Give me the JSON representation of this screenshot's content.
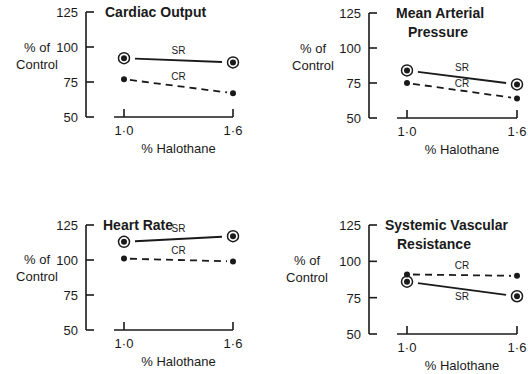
{
  "chart_data": [
    {
      "type": "line",
      "title": "Cardiac Output",
      "title_lines": [
        "Cardiac Output"
      ],
      "xlabel": "% Halothane",
      "ylabel": "% of Control",
      "x": [
        1.0,
        1.6
      ],
      "x_tick_labels": [
        "1·0",
        "1·6"
      ],
      "y_ticks": [
        125,
        100,
        75,
        50
      ],
      "ylim": [
        50,
        125
      ],
      "grid": false,
      "series": [
        {
          "name": "SR",
          "style": "solid",
          "marker": "ringed-dot",
          "values": [
            92,
            89
          ]
        },
        {
          "name": "CR",
          "style": "dashed",
          "marker": "dot",
          "values": [
            77,
            67
          ]
        }
      ]
    },
    {
      "type": "line",
      "title": "Mean Arterial Pressure",
      "title_lines": [
        "Mean Arterial",
        "Pressure"
      ],
      "xlabel": "% Halothane",
      "ylabel": "% of Control",
      "x": [
        1.0,
        1.6
      ],
      "x_tick_labels": [
        "1·0",
        "1·6"
      ],
      "y_ticks": [
        125,
        100,
        75,
        50
      ],
      "ylim": [
        50,
        125
      ],
      "grid": false,
      "series": [
        {
          "name": "SR",
          "style": "solid",
          "marker": "ringed-dot",
          "values": [
            84,
            74
          ]
        },
        {
          "name": "CR",
          "style": "dashed",
          "marker": "dot",
          "values": [
            75,
            64
          ]
        }
      ]
    },
    {
      "type": "line",
      "title": "Heart Rate",
      "title_lines": [
        "Heart Rate"
      ],
      "xlabel": "% Halothane",
      "ylabel": "% of Control",
      "x": [
        1.0,
        1.6
      ],
      "x_tick_labels": [
        "1·0",
        "1·6"
      ],
      "y_ticks": [
        125,
        100,
        75,
        50
      ],
      "ylim": [
        50,
        125
      ],
      "grid": false,
      "series": [
        {
          "name": "SR",
          "style": "solid",
          "marker": "ringed-dot",
          "values": [
            113,
            117
          ]
        },
        {
          "name": "CR",
          "style": "dashed",
          "marker": "dot",
          "values": [
            101,
            99
          ]
        }
      ]
    },
    {
      "type": "line",
      "title": "Systemic Vascular Resistance",
      "title_lines": [
        "Systemic Vascular",
        "Resistance"
      ],
      "xlabel": "% Halothane",
      "ylabel": "% of Control",
      "x": [
        1.0,
        1.6
      ],
      "x_tick_labels": [
        "1·0",
        "1·6"
      ],
      "y_ticks": [
        125,
        100,
        75,
        50
      ],
      "ylim": [
        50,
        125
      ],
      "grid": false,
      "series": [
        {
          "name": "SR",
          "style": "solid",
          "marker": "ringed-dot",
          "values": [
            86,
            76
          ]
        },
        {
          "name": "CR",
          "style": "dashed",
          "marker": "dot",
          "values": [
            91,
            90
          ]
        }
      ]
    }
  ],
  "layout": {
    "panels": [
      {
        "axis_x": 86,
        "y_top": 12,
        "y_bottom": 117,
        "x1": 124,
        "x2": 233,
        "xaxis_start": 114,
        "title_x": 105,
        "title_y": 17,
        "ylabel_x": 37,
        "ylabel_y": 52,
        "sr_label": {
          "dx": 0,
          "dy": -6
        },
        "cr_label": {
          "dx": 0,
          "dy": -6
        }
      },
      {
        "axis_x": 369,
        "y_top": 13,
        "y_bottom": 118,
        "x1": 407,
        "x2": 517,
        "xaxis_start": 397,
        "title_x": 396,
        "title_y": 18,
        "ylabel_x": 313,
        "ylabel_y": 53,
        "sr_label": {
          "dx": 0,
          "dy": -6
        },
        "cr_label": {
          "dx": 0,
          "dy": -4
        }
      },
      {
        "axis_x": 86,
        "y_top": 225,
        "y_bottom": 330,
        "x1": 124,
        "x2": 233,
        "xaxis_start": 114,
        "title_x": 103,
        "title_y": 230,
        "ylabel_x": 37,
        "ylabel_y": 264,
        "sr_label": {
          "dx": 0,
          "dy": -7
        },
        "cr_label": {
          "dx": 0,
          "dy": -6
        }
      },
      {
        "axis_x": 369,
        "y_top": 225,
        "y_bottom": 334,
        "x1": 407,
        "x2": 517,
        "xaxis_start": 397,
        "title_x": 385,
        "title_y": 230,
        "ylabel_x": 307,
        "ylabel_y": 265,
        "sr_label": {
          "dx": 0,
          "dy": 11
        },
        "cr_label": {
          "dx": 0,
          "dy": -6
        }
      }
    ],
    "ink_color": "#1a1a1a",
    "background": "#ffffff"
  }
}
